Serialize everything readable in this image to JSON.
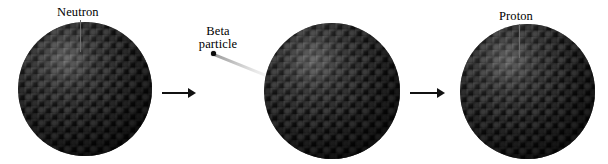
{
  "figure": {
    "background_color": "#ffffff",
    "width": 608,
    "height": 164
  },
  "labels": {
    "neutron": "Neutron",
    "beta_line1": "Beta",
    "beta_line2": "particle",
    "proton": "Proton"
  },
  "nuclei": [
    {
      "name": "nucleus-before",
      "label": "Neutron",
      "cx": 85,
      "cy": 89,
      "diameter": 134,
      "color": "#141414"
    },
    {
      "name": "nucleus-during",
      "label": "",
      "cx": 332,
      "cy": 91,
      "diameter": 136,
      "color": "#141414"
    },
    {
      "name": "nucleus-after",
      "label": "Proton",
      "cx": 527,
      "cy": 92,
      "diameter": 135,
      "color": "#141414"
    }
  ],
  "arrows": [
    {
      "name": "process-arrow-1",
      "x": 162,
      "y": 89,
      "length": 34,
      "color": "#111111"
    },
    {
      "name": "process-arrow-2",
      "x": 410,
      "y": 89,
      "length": 35,
      "color": "#111111"
    }
  ],
  "beta_particle": {
    "dot_x": 211,
    "dot_y": 51,
    "dot_color": "#0b0b0b",
    "trail_color": "#c8c8c8",
    "trail_length": 64,
    "trail_angle_deg": 22
  },
  "leader_lines": [
    {
      "name": "neutron-leader",
      "x": 80,
      "y": 20,
      "length": 32,
      "color": "#6e6e6e"
    },
    {
      "name": "proton-leader",
      "x": 519,
      "y": 24,
      "length": 34,
      "color": "#6e6e6e"
    }
  ]
}
